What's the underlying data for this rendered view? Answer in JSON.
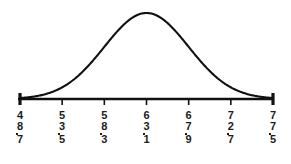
{
  "chart_data": {
    "type": "line",
    "title": "",
    "subtitle": "",
    "xlabel": "",
    "ylabel": "",
    "grid": false,
    "legend": null,
    "distribution": "normal",
    "mean": 63.1,
    "sd": 4.8,
    "tick_step": 4.8,
    "xlim": [
      48.7,
      77.5
    ],
    "ylim": [
      0,
      1
    ],
    "x_tick_labels": [
      "48.7",
      "53.5",
      "58.3",
      "63.1",
      "67.9",
      "72.7",
      "77.5"
    ],
    "x": [
      48.7,
      53.5,
      58.3,
      63.1,
      67.9,
      72.7,
      77.5
    ],
    "values": [
      0.011,
      0.088,
      0.368,
      0.607,
      0.368,
      0.088,
      0.011
    ],
    "series": [
      {
        "name": "normal-density",
        "values": [
          0.011,
          0.088,
          0.368,
          0.607,
          0.368,
          0.088,
          0.011
        ]
      }
    ],
    "colors": {
      "curve": "#111111",
      "axis": "#111111",
      "background": "#ffffff",
      "text": "#1b1b1b"
    }
  },
  "axis": {
    "name": "horizontal-axis",
    "tick_count": 7,
    "end_ticks_emphasized": true
  },
  "ticks": [
    {
      "label_digits": [
        "4",
        "8"
      ],
      "decimal": "7",
      "value": "48.7"
    },
    {
      "label_digits": [
        "5",
        "3"
      ],
      "decimal": "5",
      "value": "53.5"
    },
    {
      "label_digits": [
        "5",
        "8"
      ],
      "decimal": "3",
      "value": "58.3"
    },
    {
      "label_digits": [
        "6",
        "3"
      ],
      "decimal": "1",
      "value": "63.1"
    },
    {
      "label_digits": [
        "6",
        "7"
      ],
      "decimal": "9",
      "value": "67.9"
    },
    {
      "label_digits": [
        "7",
        "2"
      ],
      "decimal": "7",
      "value": "72.7"
    },
    {
      "label_digits": [
        "7",
        "7"
      ],
      "decimal": "5",
      "value": "77.5"
    }
  ]
}
